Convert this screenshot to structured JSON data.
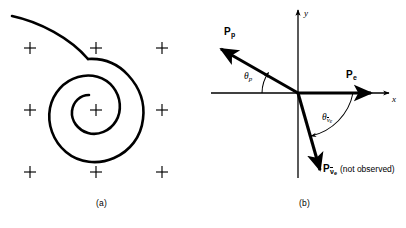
{
  "figure": {
    "panel_a": {
      "caption": "(a)",
      "field_symbol": "+",
      "field_grid": {
        "rows": 3,
        "cols": 3,
        "x": [
          30,
          96,
          162
        ],
        "y": [
          48,
          110,
          172
        ]
      },
      "track": {
        "name": "spiral-particle-track",
        "description": "inward clockwise spiral with entry tail from upper left"
      }
    },
    "panel_b": {
      "caption": "(b)",
      "axes": {
        "x_label": "x",
        "y_label": "y"
      },
      "vectors": [
        {
          "id": "proton",
          "symbol": "P",
          "subscript": "p",
          "note": "",
          "angle_deg": 151,
          "length": 92
        },
        {
          "id": "electron",
          "symbol": "P",
          "subscript": "e",
          "note": "",
          "angle_deg": 0,
          "length": 76
        },
        {
          "id": "antineutrino",
          "symbol": "P",
          "subscript": "ν",
          "subscript_sub": "e",
          "note": "(not observed)",
          "angle_deg": -76,
          "length": 84
        }
      ],
      "angles": [
        {
          "id": "theta-proton",
          "symbol": "θ",
          "subscript": "p"
        },
        {
          "id": "theta-antineutrino",
          "symbol": "θ",
          "subscript": "ν",
          "subscript_sub": "e"
        }
      ]
    }
  },
  "colors": {
    "ink": "#000000",
    "background": "#ffffff"
  }
}
